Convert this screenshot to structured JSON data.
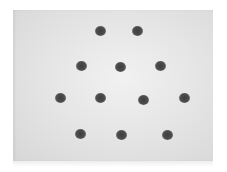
{
  "image": {
    "description": "Photograph of a light gray card with 12 dark gray dots arranged in a hexagonal/triangular lattice",
    "panel": {
      "left": 13,
      "top": 10,
      "width": 200,
      "height": 151,
      "color": "#e2e2e2"
    },
    "dot_color": "#474747",
    "dot_diameter": 11,
    "dots": [
      {
        "x": 100,
        "y": 31
      },
      {
        "x": 137,
        "y": 31
      },
      {
        "x": 81,
        "y": 66
      },
      {
        "x": 120,
        "y": 67
      },
      {
        "x": 160,
        "y": 66
      },
      {
        "x": 60,
        "y": 98
      },
      {
        "x": 100,
        "y": 98
      },
      {
        "x": 143,
        "y": 100
      },
      {
        "x": 184,
        "y": 98
      },
      {
        "x": 80,
        "y": 134
      },
      {
        "x": 121,
        "y": 135
      },
      {
        "x": 167,
        "y": 135
      }
    ]
  }
}
